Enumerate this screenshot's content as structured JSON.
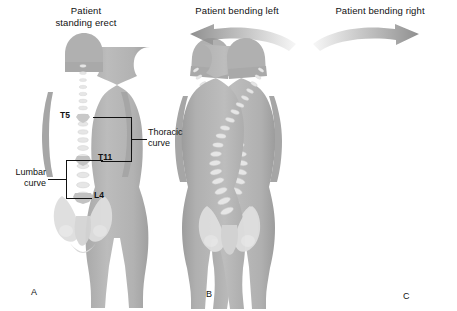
{
  "illustration": {
    "title_a": "Patient\nstanding erect",
    "panels": [
      {
        "letter": "A",
        "caption_line1": "Patient",
        "caption_line2": "standing erect",
        "posture": "neutral-erect",
        "arrow": "none"
      },
      {
        "letter": "B",
        "caption_line1": "Patient bending left",
        "caption_line2": "",
        "posture": "lateral-flexion-left",
        "arrow": "curved-arrow-left"
      },
      {
        "letter": "C",
        "caption_line1": "Patient bending right",
        "caption_line2": "",
        "posture": "lateral-flexion-right",
        "arrow": "curved-arrow-right"
      }
    ],
    "annotations": {
      "t5": "T5",
      "t11": "T11",
      "l4": "L4",
      "thoracic_line1": "Thoracic",
      "thoracic_line2": "curve",
      "lumbar_line1": "Lumbar",
      "lumbar_line2": "curve"
    },
    "colors": {
      "background": "#ffffff",
      "body_fill": "#b4b4b4",
      "body_shade": "#a2a2a2",
      "body_light": "#c4c4c4",
      "bone_fill": "#e4e4e4",
      "bone_shade": "#cfcfcf",
      "arrow_fill": "#9a9a9a",
      "leader_line": "#111111",
      "text": "#111111"
    }
  }
}
